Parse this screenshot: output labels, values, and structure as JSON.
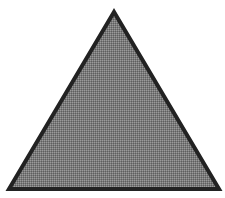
{
  "shape": {
    "type": "triangle",
    "points": "114,12 9,189 219,189",
    "fill_color": "#7b7b7b",
    "fill_pattern_light": "#9a9a9a",
    "fill_pattern_dark": "#5e5e5e",
    "stroke_color": "#222222",
    "stroke_width": "4"
  },
  "background": "#ffffff"
}
